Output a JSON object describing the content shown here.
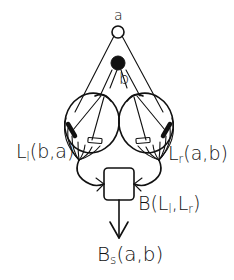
{
  "diagram": {
    "type": "binocular-vision-schematic",
    "style": "hand-drawn line art",
    "colors": {
      "ink": "#111111",
      "background": "#ffffff"
    },
    "points": {
      "a": {
        "label": "a",
        "shape": "open-circle"
      },
      "b": {
        "label": "b",
        "shape": "filled-circle"
      }
    },
    "eyes": {
      "left": {
        "label_main": "L",
        "label_sub": "l",
        "label_args": "(b,a)"
      },
      "right": {
        "label_main": "L",
        "label_sub": "r",
        "label_args": "(a,b)"
      }
    },
    "combiner": {
      "label_main": "B",
      "label_args_open": "(L",
      "label_args_sub1": "l",
      "label_args_mid": ",L",
      "label_args_sub2": "r",
      "label_args_close": ")"
    },
    "output": {
      "label_main": "B",
      "label_sub": "s",
      "label_args": "(a,b)"
    }
  }
}
